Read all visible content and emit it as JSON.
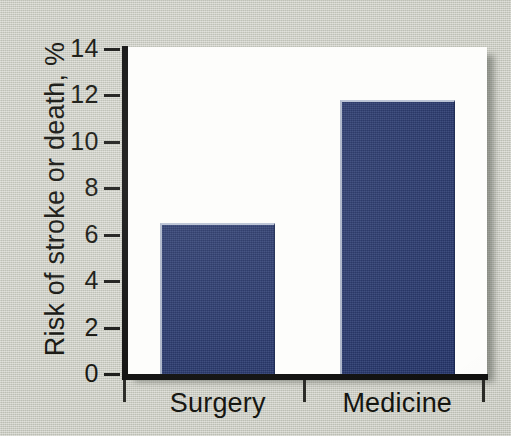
{
  "chart_data": {
    "type": "bar",
    "title": "",
    "subtitle": "",
    "xlabel": "",
    "ylabel": "Risk of stroke or death, %",
    "categories": [
      "Surgery",
      "Medicine"
    ],
    "values": [
      6.5,
      11.8
    ],
    "series": [
      {
        "name": "Risk of stroke or death",
        "values": [
          6.5,
          11.8
        ]
      }
    ],
    "ylim": [
      0,
      14
    ],
    "y_ticks": [
      0,
      2,
      4,
      6,
      8,
      10,
      12,
      14
    ],
    "y_tick_labels": [
      "0",
      "2",
      "4",
      "6",
      "8",
      "10",
      "12",
      "14"
    ],
    "grid": false,
    "legend": false,
    "legend_position": "none",
    "annotations": [],
    "bar_color": "#26366d",
    "bar_highlight_color": "#b9c2d4",
    "plot_background": "#fdfdfb",
    "figure_background": "#c9cbc0",
    "axis_color": "#111110",
    "text_color": "#14140f"
  },
  "axis": {
    "y_title": "Risk of stroke or death, %",
    "y_ticks": [
      {
        "label": "14",
        "value": 14
      },
      {
        "label": "12",
        "value": 12
      },
      {
        "label": "10",
        "value": 10
      },
      {
        "label": "8",
        "value": 8
      },
      {
        "label": "6",
        "value": 6
      },
      {
        "label": "4",
        "value": 4
      },
      {
        "label": "2",
        "value": 2
      },
      {
        "label": "0",
        "value": 0
      }
    ],
    "x_categories": [
      {
        "label": "Surgery"
      },
      {
        "label": "Medicine"
      }
    ]
  }
}
